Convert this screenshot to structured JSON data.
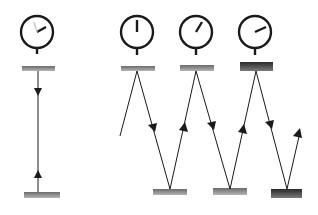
{
  "diagram": {
    "colors": {
      "line": "#1a1a1a",
      "mirror_light": "#8a8a8a",
      "mirror_dark": "#3a3a3a",
      "background": "#ffffff"
    },
    "stationary_clock": {
      "clock": {
        "cx": 37,
        "cy": 32,
        "r": 16,
        "hand_angle_deg": 60
      },
      "top_mirror": {
        "x": 22,
        "y": 66,
        "w": 33,
        "h": 5
      },
      "bottom_mirror": {
        "x": 24,
        "y": 192,
        "w": 36,
        "h": 6
      },
      "light_path": {
        "x": 38,
        "y1": 71,
        "y2": 192
      }
    },
    "moving_clocks": [
      {
        "cx": 137,
        "cy": 32,
        "r": 16,
        "hand_angle_deg": 0,
        "mirror": {
          "x": 121,
          "y": 66,
          "w": 34,
          "h": 5
        }
      },
      {
        "cx": 196,
        "cy": 32,
        "r": 16,
        "hand_angle_deg": 30,
        "mirror": {
          "x": 180,
          "y": 65,
          "w": 34,
          "h": 6
        }
      },
      {
        "cx": 255,
        "cy": 32,
        "r": 16,
        "hand_angle_deg": 65,
        "mirror": {
          "x": 240,
          "y": 62,
          "w": 33,
          "h": 9
        }
      }
    ],
    "bottom_mirrors": [
      {
        "x": 153,
        "y": 189,
        "w": 34,
        "h": 6
      },
      {
        "x": 213,
        "y": 188,
        "w": 34,
        "h": 7
      },
      {
        "x": 271,
        "y": 189,
        "w": 31,
        "h": 9
      }
    ],
    "light_zigzag": [
      [
        120,
        136
      ],
      [
        137,
        71
      ],
      [
        170,
        189
      ],
      [
        196,
        71
      ],
      [
        230,
        189
      ],
      [
        256,
        71
      ],
      [
        287,
        189
      ],
      [
        300,
        132
      ]
    ]
  }
}
